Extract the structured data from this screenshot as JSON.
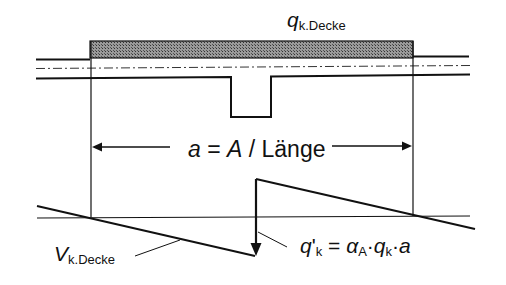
{
  "diagram": {
    "load_label": {
      "main": "q",
      "sub": "k.Decke"
    },
    "dimension_label": {
      "a": "a",
      "eq": " = ",
      "A": "A",
      "rest": " / Länge"
    },
    "shear_label": {
      "main": "V",
      "sub": "k.Decke"
    },
    "point_load_label": {
      "q": "q",
      "prime": "'",
      "k1": "k",
      "eq": " = ",
      "alpha": "α",
      "A": "A",
      "dot1": "·",
      "q2": "q",
      "k2": "k",
      "dot2": "·",
      "a": "a"
    },
    "colors": {
      "line": "#111111",
      "hatch": "#7a7a7a",
      "background": "#ffffff"
    }
  }
}
